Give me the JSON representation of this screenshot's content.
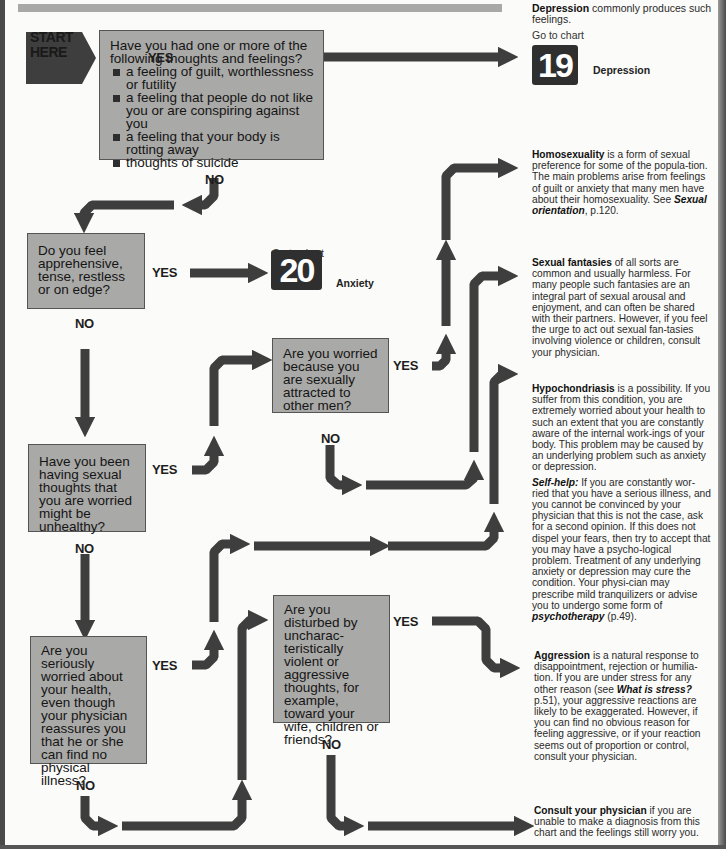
{
  "start": {
    "line1": "START",
    "line2": "HERE"
  },
  "labels": {
    "yes": "YES",
    "no": "NO"
  },
  "questions": {
    "q1": {
      "intro": "Have you had one or more of the following thoughts and feelings?",
      "bullets": [
        "a feeling of guilt, worthlessness or futility",
        "a feeling that people do not like you or are conspiring against you",
        "a feeling that your body is rotting away",
        "thoughts of suicide"
      ]
    },
    "q2": "Do you feel apprehensive, tense, restless or on edge?",
    "q3": "Are you worried because you are sexually attracted to other men?",
    "q4": "Have you been having sexual thoughts that you are worried might be unhealthy?",
    "q5": "Are you disturbed by uncharac-teristically violent or aggressive thoughts, for example, toward your wife, children or friends?",
    "q6": "Are you seriously worried about your health, even though your physician reassures you that he or she can find no physical illness?"
  },
  "outcomes": {
    "depression": {
      "title": "Depression",
      "text": " commonly produces such feelings.",
      "goto": "Go to chart",
      "chart_number": "19",
      "chart_name": "Depression"
    },
    "anxiety": {
      "goto": "Go to chart",
      "chart_number": "20",
      "chart_name": "Anxiety"
    },
    "homosexuality": {
      "title": "Homosexuality",
      "text": " is a form of sexual preference for some of the popula-tion. The main problems arise from feelings of guilt or anxiety that many men have about their homosexuality. See ",
      "ref": "Sexual orientation",
      "ref_page": ", p.120."
    },
    "sexual_fantasies": {
      "title": "Sexual fantasies",
      "text": " of all sorts are common and usually harmless. For many people such fantasies are an integral part of sexual arousal and enjoyment, and can often be shared with their partners. However, if you feel the urge to act out sexual fan-tasies involving violence or children, consult your physician."
    },
    "hypochondriasis": {
      "title": "Hypochondriasis",
      "text": " is a possibility. If you suffer from this condition, you are extremely worried about your health to such an extent that you are constantly aware of the internal work-ings of your body. This problem may be caused by an underlying problem such as anxiety or depression.",
      "selfhelp_title": "Self-help:",
      "selfhelp_text": " If you are constantly wor-ried that you have a serious illness, and you cannot be convinced by your physician that this is not the case, ask for a second opinion. If this does not dispel your fears, then try to accept that you may have a psycho-logical problem. Treatment of any underlying anxiety or depression may cure the condition. Your physi-cian may prescribe mild tranquilizers or advise you to undergo some form of ",
      "selfhelp_ref": "psychotherapy",
      "selfhelp_ref_page": " (p.49)."
    },
    "aggression": {
      "title": "Aggression",
      "text": " is a natural response to disappointment, rejection or humilia-tion. If you are under stress for any other reason (see ",
      "ref": "What is stress?",
      "text2": " p.51), your aggressive reactions are likely to be exaggerated. However, if you can find no obvious reason for feeling aggressive, or if your reaction seems out of proportion or control, consult your physician."
    },
    "consult": {
      "title": "Consult your physician",
      "text": " if you are unable to make a diagnosis from this chart and the feelings still worry you."
    }
  },
  "colors": {
    "arrow": "#3e3e3e",
    "question_box": "#a9a9a7",
    "chart_box": "#2f2f2f",
    "background": "#fbfbf9"
  }
}
